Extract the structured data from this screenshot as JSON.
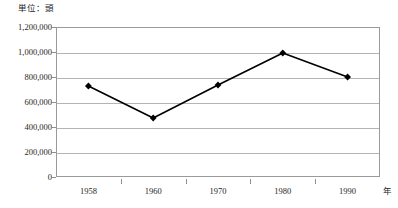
{
  "chart_data": {
    "type": "line",
    "title": "",
    "subtitle": "",
    "unit_caption": "単位：頭",
    "xlabel": "年",
    "ylabel": "",
    "categories": [
      "1958",
      "1960",
      "1970",
      "1980",
      "1990"
    ],
    "series": [
      {
        "name": "頭数",
        "values": [
          728000,
          472000,
          736000,
          992000,
          800000
        ],
        "marker": "diamond",
        "marker_color": "#000000",
        "line_color": "#000000"
      }
    ],
    "ylim": [
      0,
      1200000
    ],
    "ytick_values": [
      0,
      200000,
      400000,
      600000,
      800000,
      1000000,
      1200000
    ],
    "ytick_labels": [
      "1,200,000",
      "1,000,000",
      "800,000",
      "600,000",
      "400,000",
      "200,000",
      "0"
    ],
    "grid": true,
    "grid_axis": "y",
    "legend": false,
    "legend_position": "none",
    "axis_frame": true,
    "background_color": "#ffffff",
    "grid_color": "#b4b4b4",
    "frame_color": "#9a9a9a"
  }
}
